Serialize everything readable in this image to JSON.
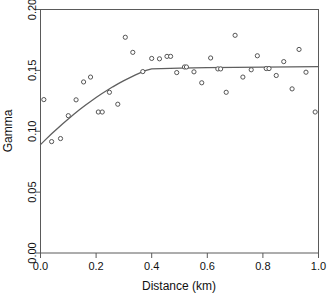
{
  "chart_data": {
    "type": "scatter",
    "title": "",
    "xlabel": "Distance (km)",
    "ylabel": "Gamma",
    "xlim": [
      0.0,
      1.0
    ],
    "ylim": [
      0.0,
      0.2
    ],
    "xticks": [
      0.0,
      0.2,
      0.4,
      0.6,
      0.8,
      1.0
    ],
    "xtick_labels": [
      "0.0",
      "0.2",
      "0.4",
      "0.6",
      "0.8",
      "1.0"
    ],
    "yticks": [
      0.0,
      0.05,
      0.1,
      0.15,
      0.2
    ],
    "ytick_labels": [
      "0.00",
      "0.05",
      "0.10",
      "0.15",
      "0.20"
    ],
    "grid": false,
    "legend": false,
    "marker": "open-circle",
    "marker_color": "#555555",
    "line_color": "#5f5f5f",
    "series": [
      {
        "name": "empirical variogram",
        "kind": "points",
        "x": [
          0.012,
          0.04,
          0.072,
          0.1,
          0.128,
          0.155,
          0.18,
          0.208,
          0.222,
          0.248,
          0.278,
          0.305,
          0.332,
          0.368,
          0.4,
          0.428,
          0.455,
          0.468,
          0.49,
          0.518,
          0.525,
          0.552,
          0.58,
          0.612,
          0.638,
          0.648,
          0.668,
          0.7,
          0.728,
          0.758,
          0.78,
          0.812,
          0.822,
          0.848,
          0.875,
          0.905,
          0.93,
          0.955,
          0.988
        ],
        "y": [
          0.126,
          0.0915,
          0.094,
          0.1128,
          0.1258,
          0.1405,
          0.1445,
          0.1158,
          0.1158,
          0.132,
          0.1222,
          0.1772,
          0.1648,
          0.149,
          0.1598,
          0.1595,
          0.1615,
          0.1615,
          0.1482,
          0.1528,
          0.1528,
          0.1488,
          0.1398,
          0.1602,
          0.1512,
          0.1512,
          0.132,
          0.1788,
          0.1445,
          0.1505,
          0.162,
          0.1515,
          0.1515,
          0.1458,
          0.1572,
          0.1348,
          0.1672,
          0.1485,
          0.1158
        ]
      },
      {
        "name": "fitted variogram model",
        "kind": "line",
        "x": [
          0.0,
          0.02,
          0.04,
          0.06,
          0.08,
          0.1,
          0.12,
          0.14,
          0.16,
          0.18,
          0.2,
          0.22,
          0.24,
          0.26,
          0.28,
          0.3,
          0.32,
          0.34,
          0.36,
          0.38,
          0.4,
          0.5,
          0.6,
          0.7,
          0.8,
          0.9,
          1.0
        ],
        "y": [
          0.089,
          0.0935,
          0.0979,
          0.1021,
          0.1062,
          0.1101,
          0.1139,
          0.1176,
          0.1211,
          0.1245,
          0.1277,
          0.1308,
          0.1337,
          0.1365,
          0.1391,
          0.1416,
          0.1439,
          0.1461,
          0.1481,
          0.15,
          0.1512,
          0.1519,
          0.1522,
          0.1524,
          0.1526,
          0.1528,
          0.153
        ]
      }
    ]
  },
  "axes": {
    "x_title": "Distance (km)",
    "y_title": "Gamma"
  }
}
